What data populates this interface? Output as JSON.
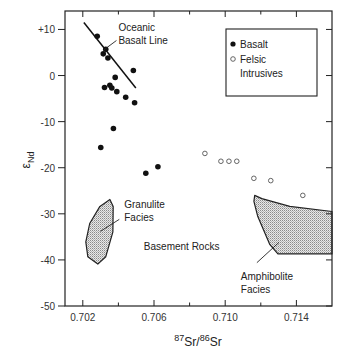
{
  "chart_data": {
    "type": "scatter",
    "title": "",
    "xlabel": {
      "sup1": "87",
      "base1": "Sr",
      "sep": "/",
      "sup2": "86",
      "base2": "Sr"
    },
    "ylabel": {
      "symbol": "ε",
      "sub": "Nd"
    },
    "xlim": [
      0.701,
      0.716
    ],
    "ylim": [
      -50,
      14
    ],
    "x_ticks_major": [
      0.702,
      0.706,
      0.71,
      0.714
    ],
    "x_ticks_minor": [
      0.704,
      0.708,
      0.712
    ],
    "x_tick_labels": [
      "0.702",
      "0.706",
      "0.710",
      "0.714"
    ],
    "y_ticks": [
      10,
      0,
      -10,
      -20,
      -30,
      -40,
      -50
    ],
    "y_tick_labels": [
      "+10",
      "0",
      "-10",
      "-20",
      "-30",
      "-40",
      "-50"
    ],
    "grid": false,
    "legend": {
      "placement": "top-right",
      "entries": [
        {
          "label": "Basalt",
          "marker": "filled-circle"
        },
        {
          "label_lines": [
            "Felsic",
            "Intrusives"
          ],
          "marker": "open-circle"
        }
      ]
    },
    "series": [
      {
        "name": "Basalt",
        "marker": "filled-circle",
        "points": [
          [
            0.70281,
            8.5
          ],
          [
            0.70329,
            5.7
          ],
          [
            0.70315,
            4.7
          ],
          [
            0.70341,
            3.8
          ],
          [
            0.70484,
            1.1
          ],
          [
            0.70382,
            -0.4
          ],
          [
            0.70322,
            -2.6
          ],
          [
            0.70352,
            -2.1
          ],
          [
            0.70363,
            -2.7
          ],
          [
            0.70391,
            -3.5
          ],
          [
            0.70441,
            -4.7
          ],
          [
            0.70491,
            -5.9
          ],
          [
            0.70372,
            -11.5
          ],
          [
            0.70301,
            -15.6
          ],
          [
            0.70554,
            -21.2
          ],
          [
            0.70622,
            -19.8
          ]
        ]
      },
      {
        "name": "Felsic Intrusives",
        "marker": "open-circle",
        "points": [
          [
            0.70886,
            -16.9
          ],
          [
            0.70976,
            -18.6
          ],
          [
            0.71021,
            -18.6
          ],
          [
            0.71065,
            -18.6
          ],
          [
            0.71161,
            -22.3
          ],
          [
            0.71256,
            -22.8
          ],
          [
            0.71436,
            -26.0
          ]
        ]
      }
    ],
    "reference_lines": [
      {
        "name": "Oceanic Basalt Line",
        "points": [
          [
            0.70206,
            11.5
          ],
          [
            0.70498,
            -2.7
          ]
        ]
      }
    ],
    "regions": [
      {
        "name": "Granulite Facies",
        "polygon": [
          [
            0.70352,
            -26.9
          ],
          [
            0.70371,
            -28.4
          ],
          [
            0.70369,
            -33.9
          ],
          [
            0.70329,
            -39.3
          ],
          [
            0.70284,
            -40.9
          ],
          [
            0.70228,
            -39.3
          ],
          [
            0.70217,
            -36.1
          ],
          [
            0.70239,
            -32.1
          ],
          [
            0.70296,
            -28.4
          ]
        ]
      },
      {
        "name": "Amphibolite Facies",
        "polygon": [
          [
            0.71166,
            -26.0
          ],
          [
            0.71206,
            -26.7
          ],
          [
            0.71363,
            -28.4
          ],
          [
            0.716,
            -29.5
          ],
          [
            0.716,
            -38.7
          ],
          [
            0.71296,
            -38.7
          ],
          [
            0.71251,
            -36.7
          ],
          [
            0.71183,
            -30.6
          ],
          [
            0.71161,
            -27.3
          ]
        ]
      }
    ],
    "annotations": [
      {
        "name": "oceanic-basalt-line-label",
        "lines": [
          "Oceanic",
          "Basalt Line"
        ],
        "at": [
          0.704,
          9.6
        ],
        "leader": [
          [
            0.70389,
            7.6
          ],
          [
            0.70316,
            5.5
          ]
        ]
      },
      {
        "name": "granulite-facies-label",
        "lines": [
          "Granulite",
          "Facies"
        ],
        "at": [
          0.70433,
          -28.8
        ],
        "leader": [
          [
            0.70405,
            -31.2
          ],
          [
            0.70299,
            -33.8
          ]
        ]
      },
      {
        "name": "basement-rocks-label",
        "lines": [
          "Basement Rocks"
        ],
        "at": [
          0.70543,
          -37.8
        ]
      },
      {
        "name": "amphibolite-facies-label",
        "lines": [
          "Amphibolite",
          "Facies"
        ],
        "at": [
          0.71088,
          -44.3
        ],
        "leader": [
          [
            0.71178,
            -40.6
          ],
          [
            0.71302,
            -36.2
          ]
        ]
      }
    ]
  }
}
